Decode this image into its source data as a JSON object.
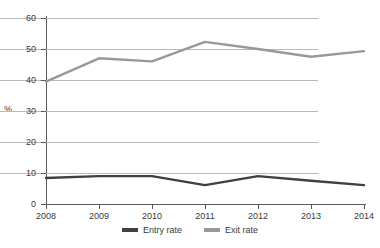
{
  "chart_data": {
    "type": "line",
    "title": "",
    "xlabel": "",
    "ylabel": "%",
    "x": [
      "2008",
      "2009",
      "2010",
      "2011",
      "2012",
      "2013",
      "2014"
    ],
    "categories": [
      "2008",
      "2009",
      "2010",
      "2011",
      "2012",
      "2013",
      "2014"
    ],
    "ylim": [
      0,
      60
    ],
    "yticks": [
      0,
      10,
      20,
      30,
      40,
      50,
      60
    ],
    "ytick_labels": [
      "0",
      "10",
      "20",
      "30",
      "40",
      "50",
      "60"
    ],
    "grid": true,
    "legend_position": "bottom-center",
    "series": [
      {
        "name": "Entry rate",
        "color": "#404040",
        "values": [
          8.4,
          9.0,
          9.0,
          6.1,
          9.0,
          7.5,
          6.1
        ]
      },
      {
        "name": "Exit rate",
        "color": "#999999",
        "values": [
          39.5,
          47.0,
          46.0,
          52.3,
          50.0,
          47.5,
          49.3
        ]
      }
    ]
  },
  "axes": {
    "y_title": "%"
  },
  "legend": {
    "items": [
      {
        "label": "Entry rate",
        "color": "#404040"
      },
      {
        "label": "Exit rate",
        "color": "#999999"
      }
    ]
  },
  "colors": {
    "entry_rate": "#404040",
    "exit_rate": "#999999",
    "gridline": "#b9b9b9",
    "axis": "#5a5a5a",
    "text": "#3a3a3a",
    "background": "#ffffff"
  }
}
